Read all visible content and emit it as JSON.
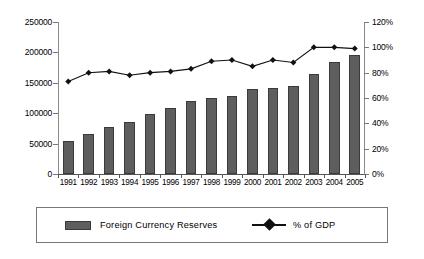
{
  "chart_data": {
    "type": "bar",
    "title": "",
    "subtitle": "",
    "xlabel": "",
    "ylabel": "",
    "grid": false,
    "legend_position": "bottom",
    "categories": [
      "1991",
      "1992",
      "1993",
      "1994",
      "1995",
      "1996",
      "1997",
      "1998",
      "1999",
      "2000",
      "2001",
      "2002",
      "2003",
      "2004",
      "2005"
    ],
    "series": [
      {
        "name": "Foreign Currency Reserves",
        "type": "bar",
        "axis": "left",
        "color": "#5e5e5e",
        "values": [
          55000,
          66000,
          78000,
          85000,
          98000,
          108000,
          120000,
          125000,
          129000,
          140000,
          141000,
          144000,
          164000,
          184000,
          195000
        ]
      },
      {
        "name": "% of GDP",
        "type": "line",
        "axis": "right",
        "color": "#111111",
        "marker": "diamond",
        "values": [
          73,
          80,
          81,
          78,
          80,
          81,
          83,
          89,
          90,
          85,
          90,
          88,
          100,
          100,
          99
        ]
      }
    ],
    "axes": {
      "left": {
        "label": "",
        "min": 0,
        "max": 250000,
        "ticks": [
          0,
          50000,
          100000,
          150000,
          200000,
          250000
        ],
        "tick_labels": [
          "0",
          "50000",
          "100000",
          "150000",
          "200000",
          "250000"
        ]
      },
      "right": {
        "label": "",
        "min": 0,
        "max": 120,
        "ticks": [
          0,
          20,
          40,
          60,
          80,
          100,
          120
        ],
        "tick_labels": [
          "0%",
          "20%",
          "40%",
          "60%",
          "80%",
          "100%",
          "120%"
        ]
      },
      "bottom": {
        "label": "",
        "tick_labels": [
          "1991",
          "1992",
          "1993",
          "1994",
          "1995",
          "1996",
          "1997",
          "1998",
          "1999",
          "2000",
          "2001",
          "2002",
          "2003",
          "2004",
          "2005"
        ]
      }
    }
  },
  "legend": {
    "items": [
      {
        "label": "Foreign Currency Reserves",
        "marker": "bar-swatch"
      },
      {
        "label": "% of GDP",
        "marker": "line-diamond"
      }
    ]
  }
}
